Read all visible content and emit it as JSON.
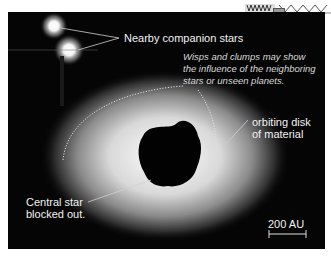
{
  "image": {
    "subject": "protoplanetary debris disk with central star masked",
    "background_color": "#050505"
  },
  "annotations": {
    "companions": "Nearby companion stars",
    "wisps_line1": "Wisps and clumps may show",
    "wisps_line2": "the influence of the neighboring",
    "wisps_line3": "stars or unseen planets.",
    "disk_line1": "orbiting disk",
    "disk_line2": "of material",
    "central_line1": "Central star",
    "central_line2": "blocked out.",
    "scale": "200 AU"
  },
  "icons": {
    "corner_artifact": "toolbar-fragment-icon"
  }
}
